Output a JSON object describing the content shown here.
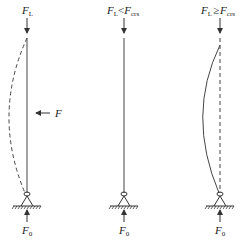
{
  "diagram": {
    "type": "column-buckling-illustration",
    "columns": [
      {
        "id": "left",
        "top_label": {
          "main": "F",
          "sub": "L"
        },
        "lateral_force_label": "F",
        "bottom_label": {
          "main": "F",
          "sub": "0"
        },
        "rod": "straight-solid",
        "deflected_shape": "dashed-bow-left"
      },
      {
        "id": "middle",
        "top_label": {
          "main": "F",
          "sub": "L",
          "relation": "<",
          "main2": "F",
          "sub2": "crs"
        },
        "bottom_label": {
          "main": "F",
          "sub": "0"
        },
        "rod": "straight-solid"
      },
      {
        "id": "right",
        "top_label": {
          "main": "F",
          "sub": "L",
          "relation": "≥",
          "main2": "F",
          "sub2": "crs"
        },
        "bottom_label": {
          "main": "F",
          "sub": "0"
        },
        "rod": "straight-dashed",
        "deflected_shape": "solid-bow-left"
      }
    ],
    "colors": {
      "stroke": "#333333",
      "background": "#ffffff"
    }
  }
}
